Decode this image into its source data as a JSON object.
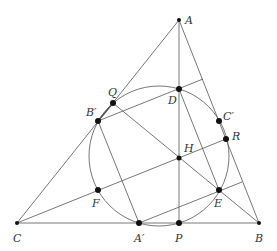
{
  "diagram": {
    "points": {
      "A": {
        "label": "A",
        "x": 179,
        "y": 20
      },
      "B": {
        "label": "B",
        "x": 259,
        "y": 223
      },
      "C": {
        "label": "C",
        "x": 17,
        "y": 223
      },
      "Ap": {
        "label": "A′",
        "x": 139,
        "y": 223
      },
      "Bp": {
        "label": "B′",
        "x": 98,
        "y": 121
      },
      "Cp": {
        "label": "C′",
        "x": 219,
        "y": 121
      },
      "D": {
        "label": "D",
        "x": 179,
        "y": 89
      },
      "E": {
        "label": "E",
        "x": 219,
        "y": 190
      },
      "F": {
        "label": "F",
        "x": 98,
        "y": 190
      },
      "H": {
        "label": "H",
        "x": 179,
        "y": 158
      },
      "P": {
        "label": "P",
        "x": 179,
        "y": 223
      },
      "Q": {
        "label": "Q",
        "x": 113,
        "y": 103
      },
      "R": {
        "label": "R",
        "x": 226,
        "y": 139
      }
    },
    "circle": {
      "cx": 159,
      "cy": 156,
      "r": 70
    }
  }
}
